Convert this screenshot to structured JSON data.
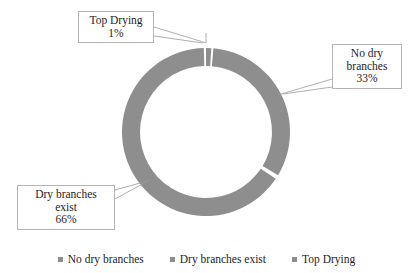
{
  "chart_data": {
    "type": "pie",
    "variant": "doughnut",
    "title": "",
    "subtitle": "",
    "xlabel": "",
    "ylabel": "",
    "categories": [
      "No dry branches",
      "Dry branches exist",
      "Top Drying"
    ],
    "values": [
      33,
      66,
      1
    ],
    "value_suffix": "%",
    "data_labels": [
      {
        "name": "No dry branches",
        "value": 33,
        "label_lines": [
          "No dry",
          "branches",
          "33%"
        ]
      },
      {
        "name": "Dry branches exist",
        "value": 66,
        "label_lines": [
          "Dry branches",
          "exist",
          "66%"
        ]
      },
      {
        "name": "Top Drying",
        "value": 1,
        "label_lines": [
          "Top Drying",
          "1%"
        ]
      }
    ],
    "legend": {
      "position": "bottom",
      "entries": [
        "No dry branches",
        "Dry branches exist",
        "Top Drying"
      ]
    },
    "grid": false,
    "colors": {
      "slice_fill": "#8e8e8e",
      "legend_marker": "#8e8e8e",
      "callout_border": "#b5b5b5",
      "leader_line": "#9a9a9a",
      "text": "#1d1d1d",
      "background": "#ffffff"
    },
    "geometry": {
      "center_x": 206,
      "center_y": 132,
      "outer_radius": 84,
      "inner_radius": 66,
      "start_angle_deg": -90
    }
  },
  "callouts": {
    "top_drying": {
      "line1": "Top Drying",
      "line2": "1%"
    },
    "no_dry_branches": {
      "line1": "No dry",
      "line2": "branches",
      "line3": "33%"
    },
    "dry_branches_exist": {
      "line1": "Dry branches",
      "line2": "exist",
      "line3": "66%"
    }
  },
  "legend": {
    "item0": "No dry branches",
    "item1": "Dry branches exist",
    "item2": "Top Drying"
  }
}
